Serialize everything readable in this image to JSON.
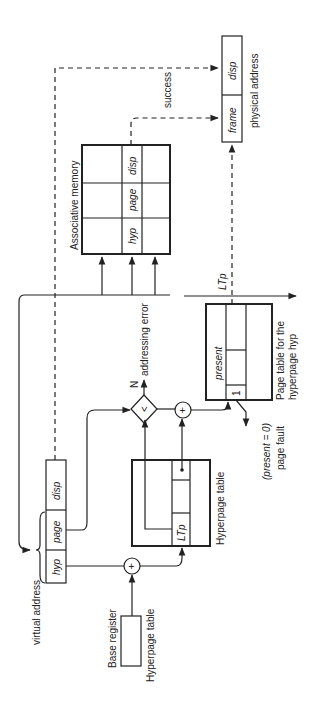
{
  "diagram": {
    "orientation": "rotated 90 degrees counter-clockwise",
    "virtual_address": {
      "label": "virtual address",
      "fields": [
        "hyp",
        "page",
        "disp"
      ]
    },
    "base_register": {
      "label": "Base register",
      "sublabel": "Hyperpage table"
    },
    "hyperpage_table": {
      "label": "Hyperpage table",
      "entry_field": "LTp"
    },
    "comparator": {
      "symbol": "<",
      "no_branch_label": "N",
      "no_branch_result": "addressing error"
    },
    "adder_symbol": "+",
    "page_table": {
      "label_line1": "Page table for the",
      "label_line2": "hyperpage hyp",
      "present_field": "present",
      "present_bit": "1",
      "fault_condition": "(present = 0)",
      "fault_result": "page fault",
      "length_label": "LTp"
    },
    "associative_memory": {
      "label": "Associative memory",
      "columns": [
        "hyp",
        "page",
        "disp"
      ]
    },
    "success_label": "success",
    "physical_address": {
      "label": "physical address",
      "fields": [
        "frame",
        "disp"
      ]
    }
  }
}
